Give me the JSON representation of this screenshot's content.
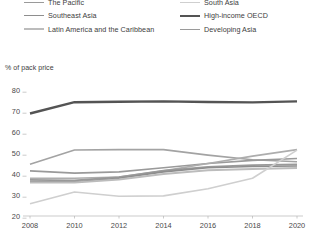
{
  "legend": {
    "items": [
      {
        "label": "Caucasus and Central Asia",
        "color": "#adadad",
        "width": 1.6,
        "column": 1
      },
      {
        "label": "The Pacific",
        "color": "#9a9a9a",
        "width": 1.6,
        "column": 1
      },
      {
        "label": "Southeast Asia",
        "color": "#8e8e8e",
        "width": 1.6,
        "column": 1
      },
      {
        "label": "Latin America and the Caribbean",
        "color": "#bcbcbc",
        "width": 2.0,
        "column": 1
      },
      {
        "label": "East Asia",
        "color": "#a3a3a3",
        "width": 1.6,
        "column": 2
      },
      {
        "label": "South Asia",
        "color": "#cfcfcf",
        "width": 1.6,
        "column": 2
      },
      {
        "label": "High-income OECD",
        "color": "#545454",
        "width": 2.4,
        "column": 2
      },
      {
        "label": "Developing Asia",
        "color": "#9a9a9a",
        "width": 1.8,
        "column": 2
      }
    ]
  },
  "chart_data": {
    "type": "line",
    "title": "",
    "ylabel": "% of pack price",
    "xlabel": "",
    "ylim": [
      20,
      80
    ],
    "yticks": [
      20,
      30,
      40,
      50,
      60,
      70,
      80
    ],
    "xlim": [
      2008,
      2020
    ],
    "xticks": [
      2008,
      2010,
      2012,
      2014,
      2016,
      2018,
      2020
    ],
    "x": [
      2008,
      2010,
      2012,
      2014,
      2016,
      2018,
      2020
    ],
    "grid": false,
    "legend_position": "top",
    "series": [
      {
        "name": "High-income OECD",
        "color": "#545454",
        "width": 2.4,
        "values": [
          68.8,
          74.2,
          74.4,
          74.6,
          74.3,
          74.1,
          74.6
        ]
      },
      {
        "name": "East Asia",
        "color": "#a3a3a3",
        "width": 1.6,
        "values": [
          44.6,
          51.4,
          51.6,
          51.6,
          49.0,
          46.8,
          45.8
        ]
      },
      {
        "name": "The Pacific",
        "color": "#9a9a9a",
        "width": 1.6,
        "values": [
          41.5,
          40.4,
          41.0,
          43.0,
          45.0,
          46.5,
          47.4
        ]
      },
      {
        "name": "Caucasus and Central Asia",
        "color": "#adadad",
        "width": 1.6,
        "values": [
          38.0,
          38.0,
          38.6,
          41.5,
          45.0,
          48.5,
          51.6
        ]
      },
      {
        "name": "Developing Asia",
        "color": "#9a9a9a",
        "width": 1.8,
        "values": [
          37.2,
          37.0,
          38.5,
          41.6,
          43.4,
          44.2,
          44.6
        ]
      },
      {
        "name": "Southeast Asia",
        "color": "#8e8e8e",
        "width": 1.6,
        "values": [
          36.4,
          36.3,
          38.0,
          41.0,
          43.0,
          43.6,
          43.8
        ]
      },
      {
        "name": "Latin America and the Caribbean",
        "color": "#bcbcbc",
        "width": 2.0,
        "values": [
          36.0,
          36.0,
          37.4,
          40.0,
          41.8,
          42.4,
          42.8
        ]
      },
      {
        "name": "South Asia",
        "color": "#cfcfcf",
        "width": 1.6,
        "values": [
          25.8,
          31.4,
          29.4,
          29.6,
          33.0,
          38.0,
          51.4
        ]
      }
    ]
  }
}
